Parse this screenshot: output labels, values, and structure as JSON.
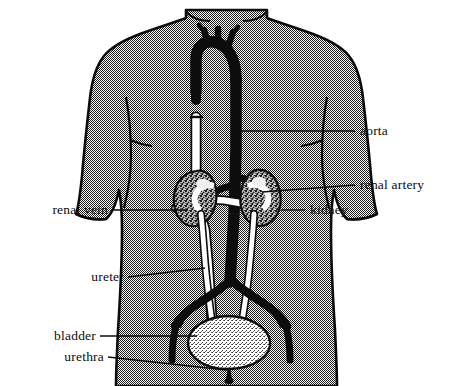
{
  "figure": {
    "background_color": "#ffffff",
    "body_fill_color": "#9a9a9a",
    "outline_color": "#0d0d0d",
    "vessel_dark_color": "#0d0d0d",
    "vessel_light_color": "#ffffff",
    "bladder_fill_color": "#dedede"
  },
  "labels": [
    {
      "id": "aorta",
      "text": "aorta",
      "side": "right"
    },
    {
      "id": "renal_artery",
      "text": "renal artery",
      "side": "right"
    },
    {
      "id": "kidney",
      "text": "kidney",
      "side": "right"
    },
    {
      "id": "renal_vein",
      "text": "renal vein",
      "side": "left"
    },
    {
      "id": "ureter",
      "text": "ureter",
      "side": "left"
    },
    {
      "id": "bladder",
      "text": "bladder",
      "side": "left"
    },
    {
      "id": "urethra",
      "text": "urethra",
      "side": "left"
    }
  ],
  "structures": [
    {
      "id": "torso",
      "name": "torso-outline"
    },
    {
      "id": "aorta",
      "name": "aorta-vessel"
    },
    {
      "id": "vena_cava",
      "name": "vena-cava-vessel"
    },
    {
      "id": "kidney_left",
      "name": "kidney-left"
    },
    {
      "id": "kidney_right",
      "name": "kidney-right"
    },
    {
      "id": "ureter_left",
      "name": "ureter-left"
    },
    {
      "id": "ureter_right",
      "name": "ureter-right"
    },
    {
      "id": "bladder",
      "name": "bladder"
    },
    {
      "id": "urethra",
      "name": "urethra"
    }
  ]
}
